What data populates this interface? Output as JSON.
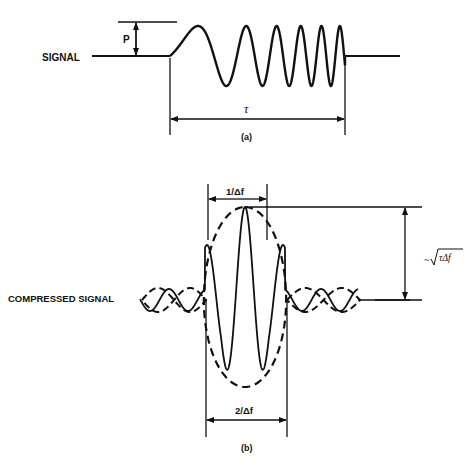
{
  "figure": {
    "panel_a": {
      "signal_label": "SIGNAL",
      "amplitude_label": "P",
      "duration_label": "τ",
      "caption": "(a)"
    },
    "panel_b": {
      "signal_label": "COMPRESSED SIGNAL",
      "mainlobe_width_label": "1/Δf",
      "base_width_label": "2/Δf",
      "gain_label_prefix": "~",
      "gain_label": "τΔf",
      "caption": "(b)"
    }
  }
}
